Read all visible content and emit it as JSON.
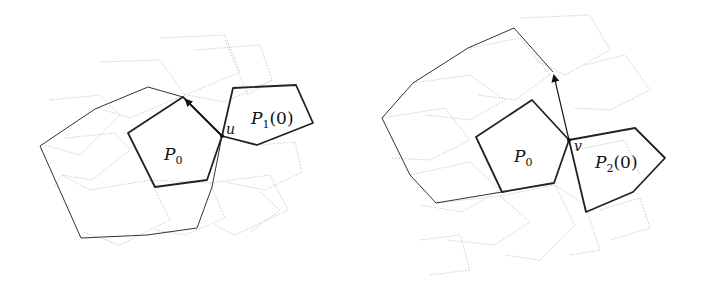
{
  "figure": {
    "left_panel": {
      "center_polygon": {
        "label": "P",
        "subscript": "0"
      },
      "adjacent_polygon": {
        "label": "P",
        "subscript": "1",
        "suffix": "(0)"
      },
      "vertex_label": "u",
      "arrow": "from u to top vertex of P0"
    },
    "right_panel": {
      "center_polygon": {
        "label": "P",
        "subscript": "0"
      },
      "adjacent_polygon": {
        "label": "P",
        "subscript": "2",
        "suffix": "(0)"
      },
      "vertex_label": "v",
      "arrow": "from v upward"
    },
    "colors": {
      "thick_stroke": "#222222",
      "grid_stroke": "#c4c4c4",
      "background": "#ffffff"
    }
  }
}
